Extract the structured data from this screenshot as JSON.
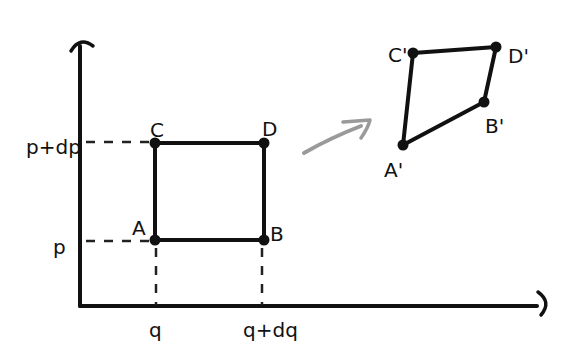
{
  "diagram": {
    "axes": {
      "vertical_axis": {
        "x": 80,
        "y_top": 40,
        "y_bottom": 306
      },
      "horizontal_axis": {
        "y": 306,
        "x_left": 80,
        "x_right": 545
      }
    },
    "labels": {
      "p_plus_dp": "p+dp",
      "p": "p",
      "q": "q",
      "q_plus_dq": "q+dq",
      "A": "A",
      "B": "B",
      "C": "C",
      "D": "D",
      "A_prime": "A'",
      "B_prime": "B'",
      "C_prime": "C'",
      "D_prime": "D'"
    },
    "original_square": {
      "A": [
        155,
        240
      ],
      "B": [
        264,
        240
      ],
      "C": [
        155,
        143
      ],
      "D": [
        264,
        143
      ]
    },
    "transformed_quadrilateral": {
      "A_prime": [
        403,
        145
      ],
      "B_prime": [
        484,
        102
      ],
      "C_prime": [
        413,
        53
      ],
      "D_prime": [
        496,
        47
      ]
    },
    "mapping_arrow": {
      "from": [
        304,
        153
      ],
      "to": [
        364,
        124
      ],
      "color": "#9a9a9a"
    },
    "ink_color": "#111111"
  }
}
